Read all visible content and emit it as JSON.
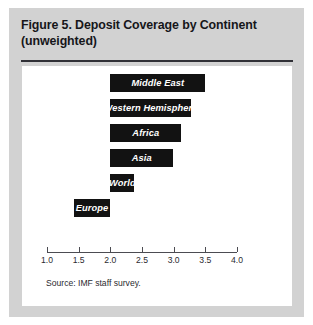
{
  "figure": {
    "title_line1": "Figure 5.  Deposit Coverage by Continent",
    "title_line2": "(unweighted)",
    "source_note": "Source:  IMF staff survey."
  },
  "chart_data": {
    "type": "bar",
    "orientation": "horizontal",
    "title": "Figure 5. Deposit Coverage by Continent (unweighted)",
    "xlabel": "",
    "ylabel": "",
    "xlim": [
      1.0,
      4.0
    ],
    "baseline": 2.0,
    "grid": false,
    "legend": null,
    "tick_labels": [
      "1.0",
      "1.5",
      "2.0",
      "2.5",
      "3.0",
      "3.5",
      "4.0"
    ],
    "ticks": [
      1.0,
      1.5,
      2.0,
      2.5,
      3.0,
      3.5,
      4.0
    ],
    "categories": [
      "Middle East",
      "Western Hemisphere",
      "Africa",
      "Asia",
      "World",
      "Europe"
    ],
    "values": [
      3.5,
      3.27,
      3.12,
      2.99,
      2.38,
      1.42
    ],
    "bars": [
      {
        "label": "Middle East",
        "start": 2.0,
        "end": 3.5
      },
      {
        "label": "Western Hemisphere",
        "start": 2.0,
        "end": 3.27
      },
      {
        "label": "Africa",
        "start": 2.0,
        "end": 3.12
      },
      {
        "label": "Asia",
        "start": 2.0,
        "end": 2.99
      },
      {
        "label": "World",
        "start": 2.0,
        "end": 2.38
      },
      {
        "label": "Europe",
        "start": 1.42,
        "end": 2.0
      }
    ],
    "colors": {
      "bar": "#121212",
      "bar_label": "#ffffff",
      "axis": "#4c4c52",
      "panel": "#ffffff",
      "frame": "#d2d2d2"
    }
  }
}
